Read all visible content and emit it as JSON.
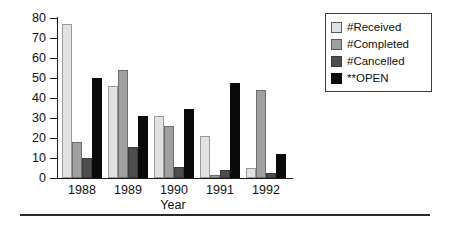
{
  "chart_data": {
    "type": "bar",
    "title": "",
    "subtitle": "",
    "xlabel": "Year",
    "ylabel": "",
    "categories": [
      "1988",
      "1989",
      "1990",
      "1991",
      "1992"
    ],
    "series": [
      {
        "name": "#Received",
        "key": "received",
        "color": "#e2e2e2",
        "values": [
          77,
          46,
          31,
          21,
          5
        ]
      },
      {
        "name": "#Completed",
        "key": "completed",
        "color": "#a0a0a0",
        "values": [
          18,
          54,
          26,
          1.5,
          44
        ]
      },
      {
        "name": "#Cancelled",
        "key": "cancelled",
        "color": "#4d4d4d",
        "values": [
          10,
          15.5,
          5.5,
          4,
          2.5
        ]
      },
      {
        "name": "**OPEN",
        "key": "open",
        "color": "#0a0a0a",
        "values": [
          50,
          31,
          34.5,
          47.5,
          12
        ]
      }
    ],
    "ylim": [
      0,
      80
    ],
    "yticks": [
      0,
      10,
      20,
      30,
      40,
      50,
      60,
      70,
      80
    ],
    "ytick_labels": [
      "0",
      "10",
      "20",
      "30",
      "40",
      "50",
      "60",
      "70",
      "80"
    ],
    "grid": false,
    "legend_position": "right-top",
    "legend_entries": [
      "#Received",
      "#Completed",
      "#Cancelled",
      "**OPEN"
    ]
  },
  "axis": {
    "x_title": "Year",
    "y_title": ""
  },
  "legend": {
    "items": [
      {
        "label": "#Received",
        "swatch": "received"
      },
      {
        "label": "#Completed",
        "swatch": "completed"
      },
      {
        "label": "#Cancelled",
        "swatch": "cancelled"
      },
      {
        "label": "**OPEN",
        "swatch": "open"
      }
    ]
  }
}
